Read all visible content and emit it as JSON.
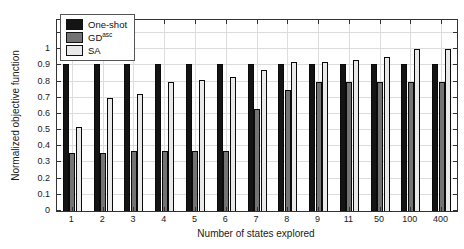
{
  "chart_data": {
    "type": "bar",
    "title": "",
    "xlabel": "Number of states explored",
    "ylabel": "Normalized objective function",
    "categories": [
      "1",
      "2",
      "3",
      "4",
      "5",
      "6",
      "7",
      "8",
      "9",
      "11",
      "50",
      "100",
      "400"
    ],
    "series": [
      {
        "name": "One-shot",
        "color": "#141414",
        "values": [
          0.91,
          0.91,
          0.91,
          0.91,
          0.91,
          0.91,
          0.91,
          0.91,
          0.91,
          0.91,
          0.91,
          0.91,
          0.91
        ]
      },
      {
        "name": "GDasc",
        "color": "#737373",
        "values": [
          0.36,
          0.36,
          0.37,
          0.37,
          0.37,
          0.37,
          0.63,
          0.75,
          0.8,
          0.8,
          0.8,
          0.8,
          0.8
        ]
      },
      {
        "name": "SA",
        "color": "#e9e9e9",
        "values": [
          0.52,
          0.7,
          0.72,
          0.8,
          0.81,
          0.83,
          0.87,
          0.92,
          0.92,
          0.93,
          0.95,
          1.0,
          1.0
        ]
      }
    ],
    "legend": [
      {
        "base": "One-shot",
        "sup": ""
      },
      {
        "base": "GD",
        "sup": "asc"
      },
      {
        "base": "SA",
        "sup": ""
      }
    ],
    "legend_position": "top-left",
    "ylim": [
      0,
      1.18
    ],
    "yticks": [
      0,
      0.1,
      0.2,
      0.3,
      0.4,
      0.5,
      0.6,
      0.7,
      0.8,
      0.9,
      1
    ],
    "ytick_labels": [
      "0",
      "0.1",
      "0.2",
      "0.3",
      "0.4",
      "0.5",
      "0.6",
      "0.7",
      "0.8",
      "0.9",
      "1"
    ],
    "grid": true,
    "colors": {
      "grid": "#dcdcdc",
      "axis": "#333333",
      "text": "#1a1a1a"
    }
  }
}
